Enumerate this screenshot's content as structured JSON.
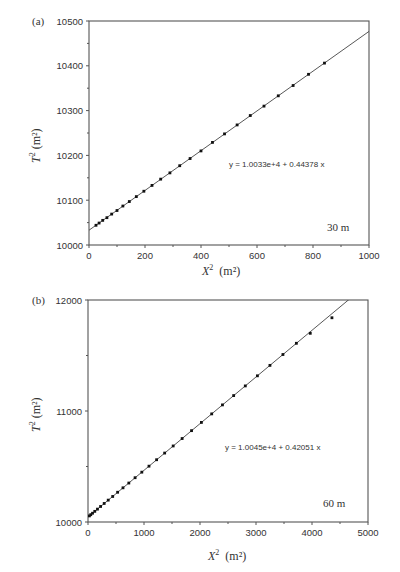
{
  "chart_data": [
    {
      "panel": "(a)",
      "type": "scatter",
      "title": "",
      "xlabel": "X² (m²)",
      "ylabel": "T² (m²)",
      "xlim": [
        0,
        1000
      ],
      "ylim": [
        10000,
        10500
      ],
      "xticks": [
        "0",
        "200",
        "400",
        "600",
        "800",
        "1000"
      ],
      "yticks": [
        "10000",
        "10100",
        "10200",
        "10300",
        "10400",
        "10500"
      ],
      "grid": false,
      "fit_equation": "y = 1.0033e+4 + 0.44378 x",
      "fit": {
        "intercept": 10033,
        "slope": 0.44378
      },
      "annotation": "30 m",
      "series": [
        {
          "name": "measured",
          "x": [
            25,
            36,
            49,
            64,
            81,
            100,
            121,
            144,
            169,
            196,
            225,
            256,
            289,
            324,
            361,
            400,
            441,
            484,
            529,
            576,
            625,
            676,
            729,
            784,
            841
          ],
          "y": [
            10044,
            10049,
            10055,
            10061,
            10069,
            10077,
            10087,
            10097,
            10108,
            10120,
            10133,
            10147,
            10161,
            10177,
            10193,
            10210,
            10229,
            10248,
            10268,
            10289,
            10310,
            10333,
            10356,
            10381,
            10406
          ]
        }
      ]
    },
    {
      "panel": "(b)",
      "type": "scatter",
      "title": "",
      "xlabel": "X² (m²)",
      "ylabel": "T² (m²)",
      "xlim": [
        0,
        5000
      ],
      "ylim": [
        10000,
        12000
      ],
      "xticks": [
        "0",
        "1000",
        "2000",
        "3000",
        "4000",
        "5000"
      ],
      "yticks": [
        "10000",
        "11000",
        "12000"
      ],
      "grid": false,
      "fit_equation": "y = 1.0045e+4 + 0.42051 x",
      "fit": {
        "intercept": 10045,
        "slope": 0.42051
      },
      "annotation": "60 m",
      "series": [
        {
          "name": "measured",
          "x": [
            25,
            49,
            81,
            121,
            169,
            225,
            289,
            361,
            441,
            529,
            625,
            729,
            841,
            961,
            1089,
            1225,
            1369,
            1521,
            1681,
            1849,
            2025,
            2209,
            2401,
            2601,
            2809,
            3025,
            3249,
            3481,
            3721,
            3969,
            4356
          ],
          "y": [
            10055,
            10066,
            10079,
            10096,
            10116,
            10140,
            10167,
            10197,
            10230,
            10268,
            10308,
            10351,
            10399,
            10449,
            10503,
            10561,
            10621,
            10685,
            10752,
            10823,
            10897,
            10974,
            11055,
            11139,
            11226,
            11317,
            11411,
            11509,
            11610,
            11700,
            11840
          ]
        }
      ]
    }
  ],
  "panels": {
    "a": {
      "label": "(a)",
      "ylabel_main": "T",
      "ylabel_unit": "(m²)",
      "xlabel_main": "X",
      "xlabel_unit": "(m²)",
      "fit_equation": "y = 1.0033e+4 + 0.44378 x",
      "depth": "30 m"
    },
    "b": {
      "label": "(b)",
      "ylabel_main": "T",
      "ylabel_unit": "(m²)",
      "xlabel_main": "X",
      "xlabel_unit": "(m²)",
      "fit_equation": "y = 1.0045e+4 + 0.42051 x",
      "depth": "60 m"
    }
  }
}
